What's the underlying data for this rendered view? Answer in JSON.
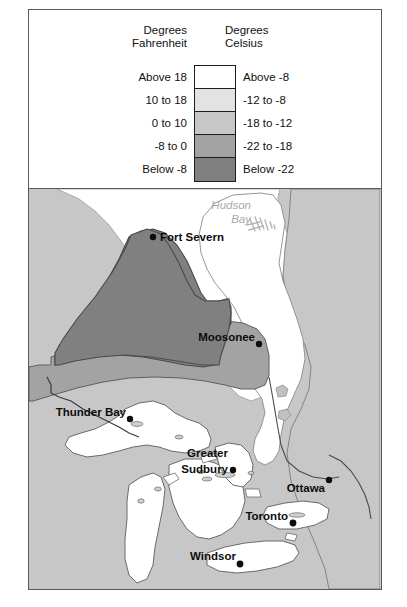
{
  "figure": {
    "kind": "choropleth-map",
    "region": "Ontario, Canada"
  },
  "legend": {
    "header_fahrenheit": "Degrees\nFahrenheit",
    "header_celsius": "Degrees\nCelsius",
    "rows": [
      {
        "fahrenheit": "Above 18",
        "celsius": "Above -8",
        "color": "#ffffff"
      },
      {
        "fahrenheit": "10 to 18",
        "celsius": "-12 to -8",
        "color": "#e3e3e3"
      },
      {
        "fahrenheit": "0 to 10",
        "celsius": "-18 to -12",
        "color": "#c7c7c7"
      },
      {
        "fahrenheit": "-8 to 0",
        "celsius": "-22 to -18",
        "color": "#a3a3a3"
      },
      {
        "fahrenheit": "Below -8",
        "celsius": "Below -22",
        "color": "#808080"
      }
    ]
  },
  "map": {
    "water_labels": [
      {
        "name": "hudson-bay",
        "line1": "Hudson",
        "line2": "Bay"
      }
    ],
    "cities": [
      {
        "name": "fort-severn",
        "label": "Fort Severn",
        "dot_side": "left"
      },
      {
        "name": "moosonee",
        "label": "Moosonee",
        "dot_side": "right"
      },
      {
        "name": "thunder-bay",
        "label": "Thunder Bay",
        "dot_side": "right"
      },
      {
        "name": "greater-sudbury",
        "label_line1": "Greater",
        "label_line2": "Sudbury",
        "dot_side": "right"
      },
      {
        "name": "ottawa",
        "label": "Ottawa",
        "dot_side": "above-right"
      },
      {
        "name": "toronto",
        "label": "Toronto",
        "dot_side": "right"
      },
      {
        "name": "windsor",
        "label": "Windsor",
        "dot_side": "right"
      }
    ],
    "colors": {
      "band_above_minus8": "#ffffff",
      "band_minus12_minus8": "#e3e3e3",
      "band_minus18_minus12": "#c7c7c7",
      "band_minus22_minus18": "#a3a3a3",
      "band_below_minus22": "#808080",
      "water": "#ffffff",
      "outline": "#3a3a3a"
    }
  }
}
